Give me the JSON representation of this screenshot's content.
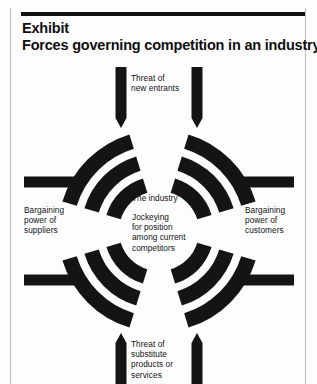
{
  "exhibit": {
    "kicker": "Exhibit",
    "title": "Forces governing competition in an industry"
  },
  "diagram": {
    "type": "porters-five-forces",
    "center": {
      "x": 159,
      "y": 231
    },
    "ring_color": "#141414",
    "arrow_color": "#141414",
    "rings": [
      {
        "index": 1,
        "outer_radius": 101,
        "inner_radius": 86
      },
      {
        "index": 2,
        "outer_radius": 78,
        "inner_radius": 63
      },
      {
        "index": 3,
        "outer_radius": 55,
        "inner_radius": 40
      }
    ],
    "quadrant_gap_degrees": 17,
    "labels": {
      "top": "Threat of\nnew entrants",
      "top_lines": [
        "Threat of",
        "new entrants"
      ],
      "left": "Bargaining\npower of\nsuppliers",
      "left_lines": [
        "Bargaining",
        "power of",
        "suppliers"
      ],
      "right": "Bargaining\npower of\ncustomers",
      "right_lines": [
        "Bargaining",
        "power of",
        "customers"
      ],
      "bottom": "Threat of\nsubstitute\nproducts or\nservices",
      "bottom_lines": [
        "Threat of",
        "substitute",
        "products or",
        "services"
      ],
      "center_title": "The industry",
      "center_body": "Jockeying\nfor position\namong current\ncompetitors",
      "center_body_lines": [
        "Jockeying",
        "for position",
        "among current",
        "competitors"
      ]
    },
    "arrows": [
      {
        "name": "threat-new-entrants-arrow-left",
        "direction": "down",
        "side": "top"
      },
      {
        "name": "threat-new-entrants-arrow-right",
        "direction": "down",
        "side": "top"
      },
      {
        "name": "suppliers-arrow-upper",
        "direction": "right",
        "side": "left"
      },
      {
        "name": "suppliers-arrow-lower",
        "direction": "right",
        "side": "left"
      },
      {
        "name": "customers-arrow-upper",
        "direction": "left",
        "side": "right"
      },
      {
        "name": "customers-arrow-lower",
        "direction": "left",
        "side": "right"
      },
      {
        "name": "substitutes-arrow-left",
        "direction": "up",
        "side": "bottom"
      },
      {
        "name": "substitutes-arrow-right",
        "direction": "up",
        "side": "bottom"
      }
    ]
  }
}
